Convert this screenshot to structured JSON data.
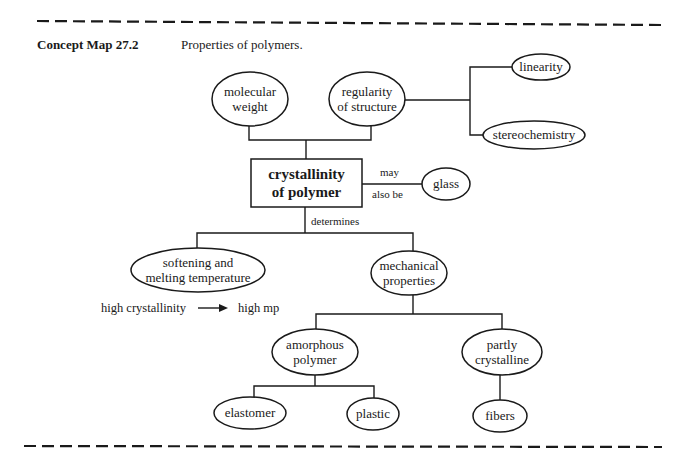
{
  "header": {
    "label": "Concept Map 27.2",
    "title": "Properties of polymers."
  },
  "nodes": {
    "molecular_weight": {
      "lines": [
        "molecular",
        "weight"
      ],
      "cx": 250,
      "cy": 99,
      "rx": 38,
      "ry": 27
    },
    "regularity": {
      "lines": [
        "regularity",
        "of structure"
      ],
      "cx": 367,
      "cy": 99,
      "rx": 38,
      "ry": 27
    },
    "linearity": {
      "lines": [
        "linearity"
      ],
      "cx": 541,
      "cy": 67,
      "rx": 29,
      "ry": 13
    },
    "stereochemistry": {
      "lines": [
        "stereochemistry"
      ],
      "cx": 534,
      "cy": 135,
      "rx": 51,
      "ry": 14
    },
    "crystallinity": {
      "lines": [
        "crystallinity",
        "of polymer"
      ],
      "x": 251,
      "y": 159,
      "w": 111,
      "h": 48
    },
    "glass": {
      "lines": [
        "glass"
      ],
      "cx": 446,
      "cy": 184,
      "rx": 24,
      "ry": 16
    },
    "softening": {
      "lines": [
        "softening and",
        "melting temperature"
      ],
      "cx": 198,
      "cy": 270,
      "rx": 67,
      "ry": 22
    },
    "mechanical": {
      "lines": [
        "mechanical",
        "properties"
      ],
      "cx": 409,
      "cy": 273,
      "rx": 38,
      "ry": 22
    },
    "amorphous": {
      "lines": [
        "amorphous",
        "polymer"
      ],
      "cx": 315,
      "cy": 352,
      "rx": 43,
      "ry": 23
    },
    "partly_crystalline": {
      "lines": [
        "partly",
        "crystalline"
      ],
      "cx": 502,
      "cy": 352,
      "rx": 40,
      "ry": 23
    },
    "elastomer": {
      "lines": [
        "elastomer"
      ],
      "cx": 250,
      "cy": 413,
      "rx": 36,
      "ry": 16
    },
    "plastic": {
      "lines": [
        "plastic"
      ],
      "cx": 373,
      "cy": 414,
      "rx": 26,
      "ry": 16
    },
    "fibers": {
      "lines": [
        "fibers"
      ],
      "cx": 500,
      "cy": 416,
      "rx": 27,
      "ry": 16
    }
  },
  "link_labels": {
    "may": "may",
    "also_be": "also be",
    "determines": "determines"
  },
  "note": {
    "left": "high crystallinity",
    "arrow": "→",
    "right": "high mp"
  },
  "colors": {
    "ink": "#1a1a1a",
    "background": "#ffffff"
  }
}
